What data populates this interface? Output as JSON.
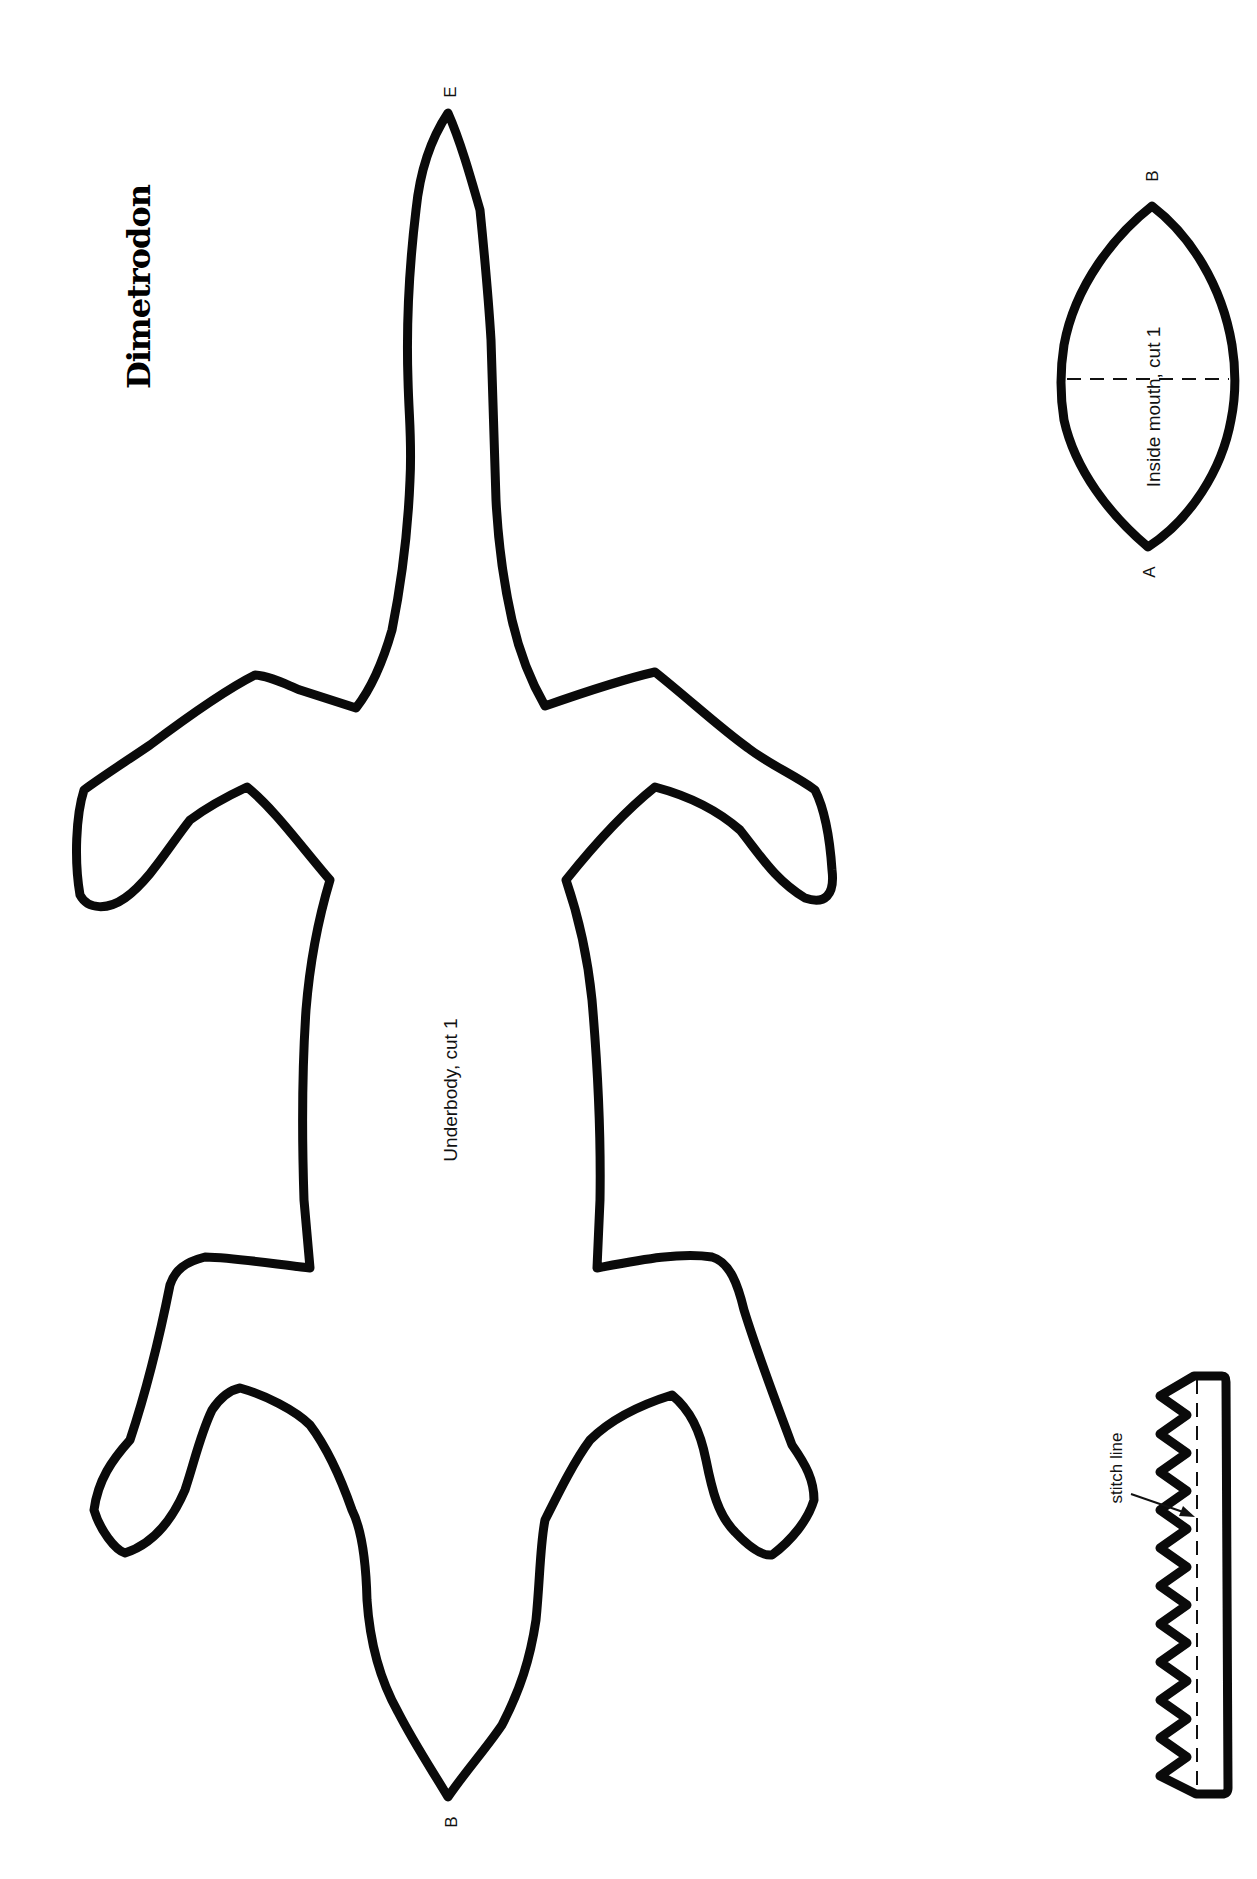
{
  "title": "Dimetrodon",
  "colors": {
    "ink": "#0a0a0a",
    "paper": "#ffffff"
  },
  "pieces": {
    "underbody": {
      "label": "Underbody, cut 1",
      "points": {
        "tail": "E",
        "head": "B"
      }
    },
    "inside_mouth": {
      "label": "Inside mouth, cut 1",
      "points": {
        "top": "B",
        "bottom": "A"
      }
    },
    "teeth": {
      "annotation": "stitch line",
      "teeth_count": 11
    }
  }
}
